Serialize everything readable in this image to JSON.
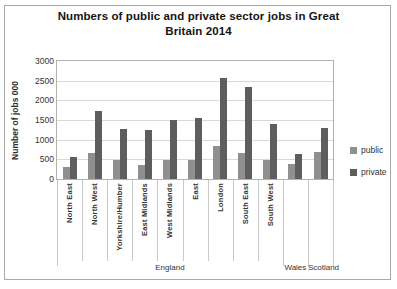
{
  "chart_data": {
    "type": "bar",
    "title": "Numbers of public and private sector jobs in Great Britain 2014",
    "title_lines": [
      "Numbers of public and private sector jobs in Great",
      "Britain 2014"
    ],
    "ylabel": "Number of jobs 000",
    "xlabel": "",
    "ylim": [
      0,
      3000
    ],
    "yticks": [
      0,
      500,
      1000,
      1500,
      2000,
      2500,
      3000
    ],
    "grid": true,
    "legend_position": "right",
    "categories": [
      "North East",
      "North West",
      "Yorkshire/Humber",
      "East Midlands",
      "West Midlands",
      "East",
      "London",
      "South East",
      "South West",
      "Wales",
      "Scotland"
    ],
    "tier1_labels": [
      "North East",
      "North West",
      "Yorkshire/Humber",
      "East Midlands",
      "West Midlands",
      "East",
      "London",
      "South East",
      "South West",
      "",
      ""
    ],
    "groups": [
      {
        "label": "England",
        "span": 9
      },
      {
        "label": "Wales",
        "span": 1
      },
      {
        "label": "Scotland",
        "span": 1
      }
    ],
    "series": [
      {
        "name": "public",
        "color": "#8f8f8f",
        "values": [
          300,
          650,
          490,
          350,
          480,
          480,
          840,
          670,
          490,
          390,
          700
        ]
      },
      {
        "name": "private",
        "color": "#5e5e5e",
        "values": [
          570,
          1730,
          1280,
          1250,
          1500,
          1550,
          2560,
          2340,
          1400,
          640,
          1290
        ]
      }
    ]
  }
}
